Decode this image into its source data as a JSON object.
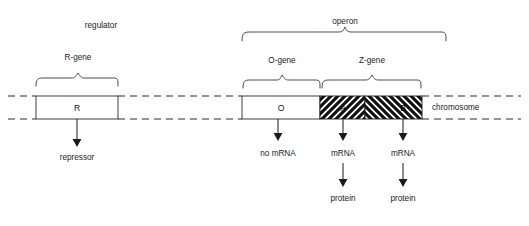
{
  "diagram": {
    "background_color": "#ffffff",
    "line_color": "#2b2b2b",
    "text_color": "#1a1a1a"
  },
  "section_labels": {
    "regulator": "regulator",
    "operon": "operon"
  },
  "gene_braces": [
    {
      "key": "r_gene",
      "label": "R-gene"
    },
    {
      "key": "o_gene",
      "label": "O-gene"
    },
    {
      "key": "z_gene",
      "label": "Z-gene"
    }
  ],
  "chromosome": {
    "label": "chromosome"
  },
  "gene_boxes": [
    {
      "key": "box_r",
      "label": "R",
      "fill": "white"
    },
    {
      "key": "box_o",
      "label": "O",
      "fill": "white"
    },
    {
      "key": "box_a",
      "label": "A",
      "fill": "hatch-up"
    },
    {
      "key": "box_b",
      "label": "B",
      "fill": "hatch-down"
    }
  ],
  "products": {
    "repressor": "repressor",
    "no_mrna": "no mRNA",
    "mrna_a": "mRNA",
    "mrna_b": "mRNA",
    "protein_a": "protein",
    "protein_b": "protein"
  }
}
